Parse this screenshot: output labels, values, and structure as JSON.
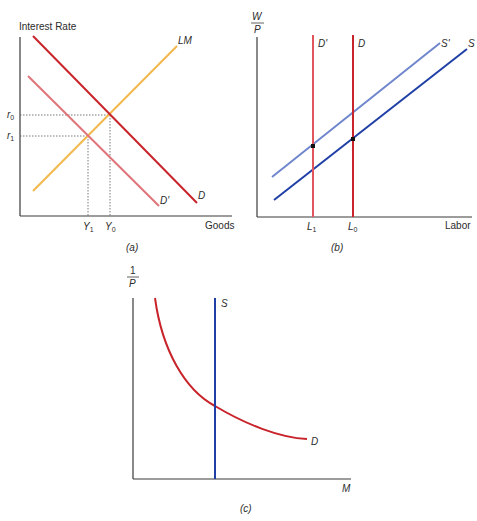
{
  "colors": {
    "axis": "#3a3a3a",
    "d": "#c8242b",
    "d_prime": "#e0747a",
    "lm": "#f2b84b",
    "s": "#1f3fa6",
    "s_prime": "#6f86cc",
    "guide": "#555555",
    "dot": "#111111"
  },
  "panel_a": {
    "caption": "(a)",
    "y_axis_label": "Interest Rate",
    "x_axis_label": "Goods",
    "curves": {
      "lm": "LM",
      "d": "D",
      "d_prime": "D'"
    },
    "y_ticks": {
      "r0_base": "r",
      "r0_sub": "0",
      "r1_base": "r",
      "r1_sub": "1"
    },
    "x_ticks": {
      "y1_base": "Y",
      "y1_sub": "1",
      "y0_base": "Y",
      "y0_sub": "0"
    }
  },
  "panel_b": {
    "caption": "(b)",
    "y_axis_label_num": "W",
    "y_axis_label_den": "P",
    "x_axis_label": "Labor",
    "curves": {
      "d": "D",
      "d_prime": "D'",
      "s": "S",
      "s_prime": "S'"
    },
    "x_ticks": {
      "l1_base": "L",
      "l1_sub": "1",
      "l0_base": "L",
      "l0_sub": "0"
    }
  },
  "panel_c": {
    "caption": "(c)",
    "y_axis_label_num": "1",
    "y_axis_label_den": "P",
    "x_axis_label": "M",
    "curves": {
      "s": "S",
      "d": "D"
    }
  }
}
